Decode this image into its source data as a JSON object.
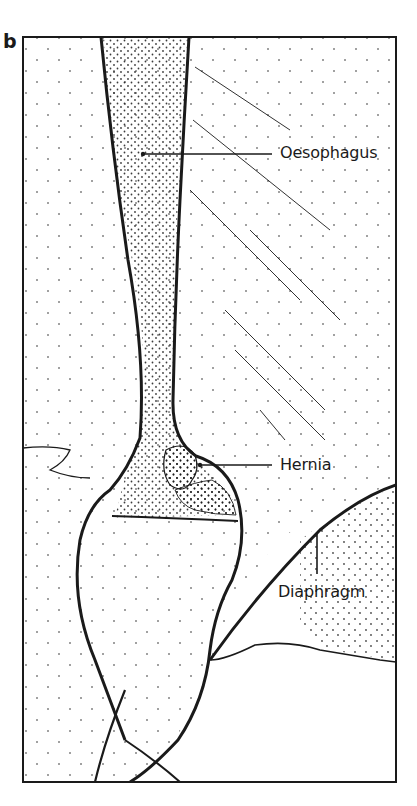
{
  "figure": {
    "panel_letter": "b",
    "labels": [
      {
        "id": "oesophagus",
        "text": "Oesophagus"
      },
      {
        "id": "hernia",
        "text": "Hernia"
      },
      {
        "id": "diaphragm",
        "text": "Diaphragm"
      }
    ]
  },
  "colors": {
    "ink": "#1a1a1a",
    "background": "#ffffff"
  }
}
